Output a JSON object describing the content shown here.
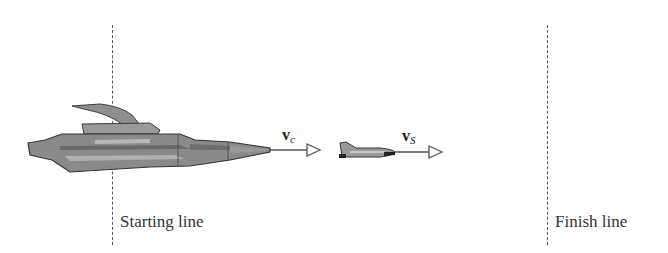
{
  "diagram": {
    "starting_line": {
      "label": "Starting line",
      "x": 112
    },
    "finish_line": {
      "label": "Finish line",
      "x": 547
    },
    "cruiser": {
      "name": "large spacecraft",
      "velocity_label": {
        "main": "v",
        "sub": "c"
      }
    },
    "shuttle": {
      "name": "small shuttle",
      "velocity_label": {
        "main": "v",
        "sub": "S"
      }
    }
  },
  "colors": {
    "line": "#555555",
    "text": "#333333",
    "ship_body": "#8a8a8a",
    "ship_dark": "#5a5a5a",
    "ship_light": "#b5b5b5"
  }
}
